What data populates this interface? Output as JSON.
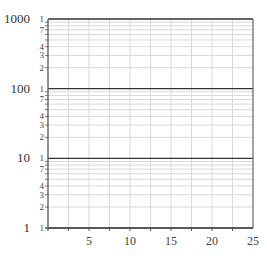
{
  "chart_data": {
    "type": "line",
    "title": "",
    "xlabel": "",
    "ylabel": "",
    "x_scale": "linear",
    "y_scale": "log",
    "xlim": [
      0,
      25
    ],
    "ylim": [
      1,
      1000
    ],
    "x_ticks": [
      5,
      10,
      15,
      20,
      25
    ],
    "x_tick_labels": [
      "5",
      "10",
      "15",
      "20",
      "25"
    ],
    "x_minor_gridlines": [
      2.5,
      5,
      7.5,
      10,
      12.5,
      15,
      17.5,
      20,
      22.5
    ],
    "y_major_ticks": [
      1,
      10,
      100,
      1000
    ],
    "y_major_tick_labels": [
      "1",
      "10",
      "100",
      "1000"
    ],
    "y_minor_tick_labels": [
      "1",
      "7",
      "4",
      "3",
      "2"
    ],
    "y_minor_gridlines_per_decade": [
      2,
      3,
      4,
      5,
      6,
      7,
      8,
      9
    ],
    "grid": true,
    "series": [],
    "legend": null
  },
  "colors": {
    "axis": "#555555",
    "major_grid": "#333333",
    "minor_grid": "#d8d8d8",
    "background": "#ffffff"
  }
}
